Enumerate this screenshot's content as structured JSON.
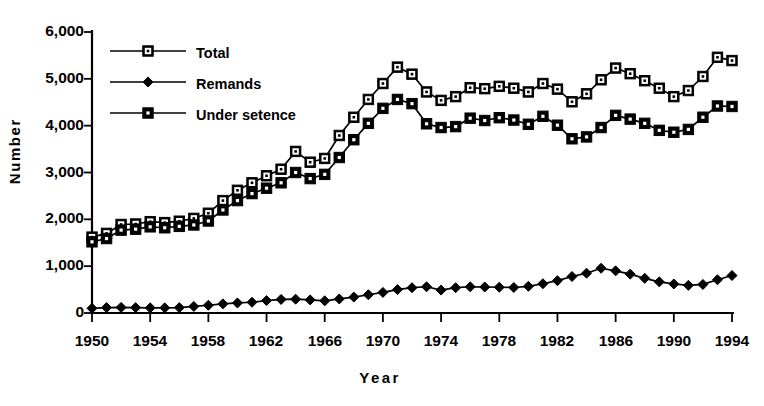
{
  "chart_data": {
    "type": "line",
    "title": "",
    "xlabel": "Year",
    "ylabel": "Number",
    "xlim": [
      1950,
      1994
    ],
    "ylim": [
      0,
      6000
    ],
    "grid": false,
    "legend_position": "upper-left-inside",
    "x_tick_labels": [
      "1950",
      "1954",
      "1958",
      "1962",
      "1966",
      "1970",
      "1974",
      "1978",
      "1982",
      "1986",
      "1990",
      "1994"
    ],
    "x_tick_values": [
      1950,
      1954,
      1958,
      1962,
      1966,
      1970,
      1974,
      1978,
      1982,
      1986,
      1990,
      1994
    ],
    "y_tick_labels": [
      "0",
      "1,000",
      "2,000",
      "3,000",
      "4,000",
      "5,000",
      "6,000"
    ],
    "y_tick_values": [
      0,
      1000,
      2000,
      3000,
      4000,
      5000,
      6000
    ],
    "x": [
      1950,
      1951,
      1952,
      1953,
      1954,
      1955,
      1956,
      1957,
      1958,
      1959,
      1960,
      1961,
      1962,
      1963,
      1964,
      1965,
      1966,
      1967,
      1968,
      1969,
      1970,
      1971,
      1972,
      1973,
      1974,
      1975,
      1976,
      1977,
      1978,
      1979,
      1980,
      1981,
      1982,
      1983,
      1984,
      1985,
      1986,
      1987,
      1988,
      1989,
      1990,
      1991,
      1992,
      1993,
      1994
    ],
    "series": [
      {
        "name": "Total",
        "marker": "open-square",
        "values": [
          1620,
          1700,
          1890,
          1900,
          1950,
          1930,
          1960,
          2020,
          2130,
          2400,
          2620,
          2780,
          2930,
          3070,
          3450,
          3220,
          3300,
          3790,
          4180,
          4560,
          4900,
          5250,
          5100,
          4720,
          4540,
          4620,
          4810,
          4790,
          4840,
          4800,
          4720,
          4900,
          4780,
          4510,
          4680,
          4980,
          5230,
          5110,
          4960,
          4800,
          4620,
          4750,
          5050,
          5460,
          5390
        ]
      },
      {
        "name": "Remands",
        "marker": "filled-diamond",
        "values": [
          100,
          115,
          120,
          115,
          110,
          110,
          115,
          140,
          165,
          195,
          215,
          230,
          265,
          290,
          295,
          280,
          260,
          300,
          340,
          390,
          440,
          500,
          540,
          560,
          490,
          540,
          560,
          555,
          550,
          545,
          570,
          625,
          690,
          780,
          850,
          955,
          900,
          830,
          740,
          665,
          620,
          590,
          610,
          710,
          800
        ]
      },
      {
        "name": "Under setence",
        "marker": "filled-square",
        "values": [
          1520,
          1590,
          1770,
          1790,
          1840,
          1820,
          1850,
          1880,
          1965,
          2200,
          2400,
          2550,
          2665,
          2780,
          3000,
          2870,
          2960,
          3320,
          3700,
          4050,
          4370,
          4560,
          4470,
          4040,
          3960,
          3980,
          4160,
          4110,
          4170,
          4120,
          4030,
          4200,
          4010,
          3720,
          3760,
          3960,
          4220,
          4140,
          4050,
          3900,
          3860,
          3920,
          4180,
          4420,
          4410
        ]
      }
    ]
  },
  "legend": {
    "items": [
      {
        "label": "Total",
        "marker": "open-square"
      },
      {
        "label": "Remands",
        "marker": "filled-diamond"
      },
      {
        "label": "Under setence",
        "marker": "filled-square"
      }
    ]
  },
  "axes": {
    "y_title": "Number",
    "x_title": "Year"
  },
  "colors": {
    "line": "#000000",
    "background": "#ffffff",
    "marker_fill_open": "#ffffff",
    "marker_fill_solid": "#000000"
  }
}
